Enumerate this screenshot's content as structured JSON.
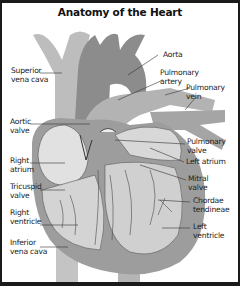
{
  "title": "Anatomy of the Heart",
  "labels": {
    "superior_vena_cava": "Superior\nvena cava",
    "aorta": "Aorta",
    "pulmonary_artery": "Pulmonary\nartery",
    "pulmonary_vein": "Pulmonary\nvein",
    "aortic_valve": "Aortic\nvalve",
    "right_atrium": "Right\natrium",
    "tricuspid_valve": "Tricuspid\nvalve",
    "right_ventricle": "Right\nventricle",
    "inferior_vena_cava": "Inferior\nvena cava",
    "pulmonary_valve": "Pulmonary\nvalve",
    "left_atrium": "Left atrium",
    "mitral_valve": "Mitral\nvalve",
    "chordae_tendineae": "Chordae\ntendineae",
    "left_ventricle": "Left\nventricle"
  },
  "colors": {
    "border": "#1a1a1a",
    "vessel_light": "#b9b9b9",
    "vessel_dark": "#8f8f8f",
    "heart_wall": "#9a9a9a",
    "chamber": "#dcdcdc",
    "leader_line": "#333333"
  }
}
